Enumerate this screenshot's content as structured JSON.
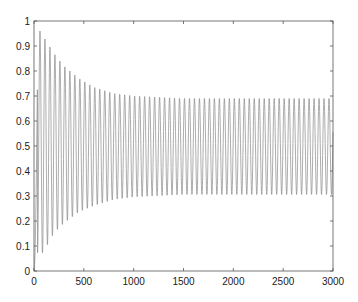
{
  "chart_data": {
    "type": "line",
    "title": "",
    "xlabel": "",
    "ylabel": "",
    "xlim": [
      0,
      3000
    ],
    "ylim": [
      0,
      1
    ],
    "grid": false,
    "legend": null,
    "x_ticks": [
      0,
      500,
      1000,
      1500,
      2000,
      2500,
      3000
    ],
    "x_tick_labels": [
      "0",
      "500",
      "1000",
      "1500",
      "2000",
      "2500",
      "3000"
    ],
    "y_ticks": [
      0,
      0.1,
      0.2,
      0.3,
      0.4,
      0.5,
      0.6,
      0.7,
      0.8,
      0.9,
      1
    ],
    "y_tick_labels": [
      "0",
      "0.1",
      "0.2",
      "0.3",
      "0.4",
      "0.5",
      "0.6",
      "0.7",
      "0.8",
      "0.9",
      "1"
    ],
    "series": [
      {
        "name": "signal",
        "color": "#8a8a8a",
        "description": "Damped oscillation converging to a sustained limit cycle",
        "period": 50,
        "start_value": 0.0,
        "initial_peak": 0.96,
        "initial_trough": 0.07,
        "steady_max": 0.69,
        "steady_min": 0.305,
        "settle_time": 1000,
        "peak_envelope": [
          {
            "x": 60,
            "y": 0.96
          },
          {
            "x": 200,
            "y": 0.87
          },
          {
            "x": 300,
            "y": 0.82
          },
          {
            "x": 450,
            "y": 0.77
          },
          {
            "x": 600,
            "y": 0.735
          },
          {
            "x": 800,
            "y": 0.71
          },
          {
            "x": 1000,
            "y": 0.7
          },
          {
            "x": 1500,
            "y": 0.69
          },
          {
            "x": 3000,
            "y": 0.69
          }
        ],
        "trough_envelope": [
          {
            "x": 90,
            "y": 0.07
          },
          {
            "x": 200,
            "y": 0.15
          },
          {
            "x": 300,
            "y": 0.19
          },
          {
            "x": 450,
            "y": 0.235
          },
          {
            "x": 600,
            "y": 0.26
          },
          {
            "x": 800,
            "y": 0.285
          },
          {
            "x": 1000,
            "y": 0.295
          },
          {
            "x": 1500,
            "y": 0.305
          },
          {
            "x": 3000,
            "y": 0.305
          }
        ]
      }
    ]
  },
  "style": {
    "axis_color": "#555555",
    "line_color": "#8a8a8a",
    "background": "#ffffff"
  }
}
